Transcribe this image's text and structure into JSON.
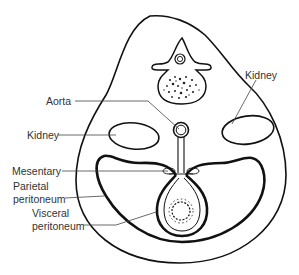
{
  "diagram": {
    "labels": {
      "kidney_right": "Kidney",
      "aorta": "Aorta",
      "kidney_left": "Kidney",
      "mesentary": "Mesentary",
      "parietal_line1": "Parietal",
      "parietal_line2": "peritoneum",
      "visceral_line1": "Visceral",
      "visceral_line2": "peritoneum"
    },
    "colors": {
      "stroke": "#111111",
      "leader": "#444444",
      "text": "#333333",
      "background": "#ffffff"
    }
  }
}
